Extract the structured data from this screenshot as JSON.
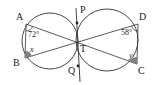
{
  "diagram": {
    "type": "geometry",
    "colors": {
      "stroke": "#333333",
      "fill_angle": "#808080",
      "background": "#ffffff"
    },
    "points": {
      "A": {
        "label": "A",
        "x": 26,
        "y": 24
      },
      "B": {
        "label": "B",
        "x": 25,
        "y": 58
      },
      "C": {
        "label": "C",
        "x": 137,
        "y": 64
      },
      "D": {
        "label": "D",
        "x": 138,
        "y": 24
      },
      "T": {
        "label": "T",
        "x": 77,
        "y": 42
      },
      "P": {
        "label": "P",
        "x": 77,
        "y": 23
      },
      "Q": {
        "label": "Q",
        "x": 78,
        "y": 66
      }
    },
    "circles": [
      {
        "name": "left-circle",
        "cx": 50,
        "cy": 41,
        "r": 28
      },
      {
        "name": "right-circle",
        "cx": 107,
        "cy": 40,
        "r": 31
      }
    ],
    "angles": {
      "angle_A": {
        "label": "72°",
        "value": 72
      },
      "angle_D": {
        "label": "58°",
        "value": 58
      },
      "angle_B": {
        "label": "x",
        "unknown": true
      },
      "angle_C": {
        "label": "y",
        "unknown": true
      }
    }
  }
}
